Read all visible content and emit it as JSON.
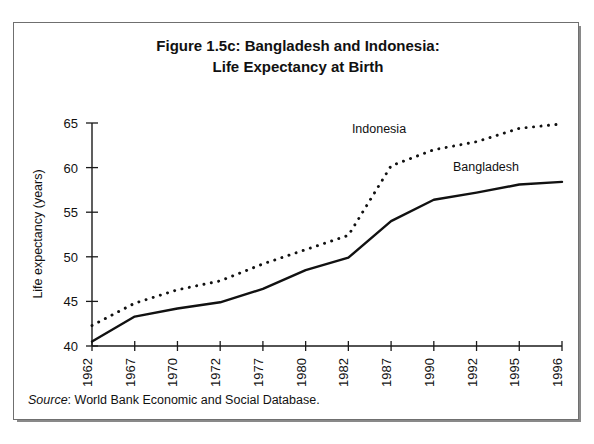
{
  "figure": {
    "title_line1": "Figure 1.5c: Bangladesh and Indonesia:",
    "title_line2": "Life Expectancy at Birth",
    "source_label": "Source",
    "source_separator": ":",
    "source_text": "World Bank Economic and Social Database.",
    "border_color": "#6f6f6f",
    "ink_color": "#111111",
    "background_color": "#ffffff"
  },
  "chart_data": {
    "type": "line",
    "title": "Figure 1.5c: Bangladesh and Indonesia: Life Expectancy at Birth",
    "xlabel": "",
    "ylabel": "Life expectancy (years)",
    "ylim": [
      40,
      65
    ],
    "ytick_values": [
      40,
      45,
      50,
      55,
      60,
      65
    ],
    "ytick_labels": [
      "40",
      "45",
      "50",
      "55",
      "60",
      "65"
    ],
    "categories": [
      "1962",
      "1967",
      "1970",
      "1972",
      "1977",
      "1980",
      "1982",
      "1987",
      "1990",
      "1992",
      "1995",
      "1996"
    ],
    "grid": false,
    "legend_position": "inline-annotations",
    "series": [
      {
        "name": "Indonesia",
        "style": "dotted",
        "label_x_category": "1982",
        "values": [
          42.3,
          44.8,
          46.3,
          47.3,
          49.2,
          50.8,
          52.4,
          60.2,
          62.0,
          62.9,
          64.4,
          64.9
        ]
      },
      {
        "name": "Bangladesh",
        "style": "solid",
        "label_x_category": "1987",
        "values": [
          40.5,
          43.3,
          44.2,
          44.9,
          46.4,
          48.5,
          49.9,
          54.0,
          56.4,
          57.2,
          58.1,
          58.4
        ]
      }
    ],
    "annotations": [
      {
        "text": "Indonesia",
        "series": "Indonesia"
      },
      {
        "text": "Bangladesh",
        "series": "Bangladesh"
      }
    ]
  }
}
